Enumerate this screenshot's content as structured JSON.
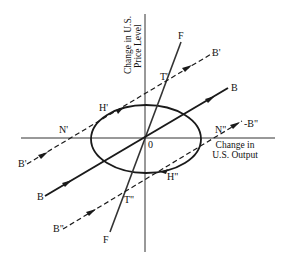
{
  "diagram": {
    "axes": {
      "y_label_line1": "Change in U.S.",
      "y_label_line2": "Price Level",
      "x_label_line1": "Change in",
      "x_label_line2": "U.S. Output",
      "origin_label": "0"
    },
    "lines": {
      "F_top": "F",
      "F_bottom": "F",
      "B_right": "B",
      "B_left": "B",
      "Bp_right": "B'",
      "Bp_left": "B'",
      "Bpp_right": "-B\"",
      "Bpp_left": "B\""
    },
    "points": {
      "T_prime": "T'",
      "T_double": "T\"",
      "H_prime": "H'",
      "H_double": "H\"",
      "N_prime": "N'",
      "N_double": "N\""
    },
    "colors": {
      "ink": "#1a1a1a",
      "background": "#ffffff"
    }
  }
}
